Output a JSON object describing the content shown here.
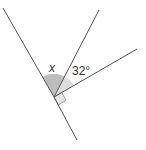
{
  "diagram": {
    "type": "angles-at-a-point",
    "vertex": [
      54,
      97
    ],
    "lines": [
      {
        "name": "line-upper-left",
        "from": [
          54,
          97
        ],
        "to": [
          3,
          8
        ]
      },
      {
        "name": "line-lower",
        "from": [
          54,
          97
        ],
        "to": [
          77,
          140
        ]
      },
      {
        "name": "ray-upper",
        "from": [
          54,
          97
        ],
        "to": [
          99,
          10
        ]
      },
      {
        "name": "ray-right",
        "from": [
          54,
          97
        ],
        "to": [
          137,
          49
        ]
      }
    ],
    "angles": {
      "unknown": {
        "label": "x",
        "fill": "#bdbdbd"
      },
      "known": {
        "label": "32°",
        "value_deg": 32,
        "fill": "#dddddd"
      },
      "right_angle": {
        "fill": "#e6e6e6"
      }
    },
    "stroke_color": "#555555"
  }
}
